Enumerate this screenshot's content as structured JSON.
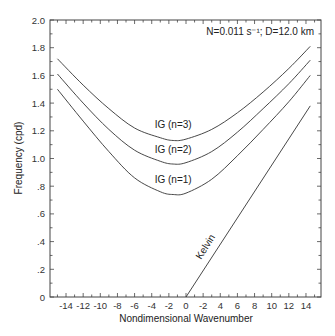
{
  "chart_data": {
    "type": "line",
    "title": "",
    "annotation": "N=0.011 s⁻¹; D=12.0 km",
    "xlabel": "Nondimensional Wavenumber",
    "ylabel": "Frequency (cpd)",
    "xlim": [
      -15.5,
      15.5
    ],
    "ylim": [
      0,
      2.0
    ],
    "grid": false,
    "legend": "none (inline curve labels)",
    "x_tick_values": [
      -14,
      -12,
      -10,
      -8,
      -6,
      -4,
      -2,
      0,
      2,
      4,
      6,
      8,
      10,
      12,
      14
    ],
    "x_tick_labels": [
      "-14",
      "-12",
      "-10",
      "-8",
      "-6",
      "-4",
      "-2",
      "0",
      "-2",
      "4",
      "6",
      "8",
      "10",
      "12",
      "14"
    ],
    "y_tick_values": [
      0,
      0.2,
      0.4,
      0.6,
      0.8,
      1.0,
      1.2,
      1.4,
      1.6,
      1.8,
      2.0
    ],
    "y_tick_labels": [
      "0",
      ".2",
      ".4",
      ".6",
      ".8",
      "1.0",
      "1.2",
      "1.4",
      "1.6",
      "1.8",
      "2.0"
    ],
    "series": [
      {
        "name": "IG (n=3)",
        "x": [
          -15,
          -12,
          -9,
          -6,
          -3,
          -1.5,
          0,
          3,
          6,
          9,
          12,
          14.5
        ],
        "values": [
          1.72,
          1.53,
          1.36,
          1.22,
          1.15,
          1.13,
          1.14,
          1.21,
          1.33,
          1.48,
          1.65,
          1.81
        ]
      },
      {
        "name": "IG (n=2)",
        "x": [
          -15,
          -12,
          -9,
          -6,
          -3,
          -1.5,
          0,
          3,
          6,
          9,
          12,
          14.5
        ],
        "values": [
          1.61,
          1.4,
          1.21,
          1.06,
          0.98,
          0.96,
          0.97,
          1.05,
          1.19,
          1.36,
          1.54,
          1.71
        ]
      },
      {
        "name": "IG (n=1)",
        "x": [
          -15,
          -12,
          -9,
          -6,
          -3,
          -1.5,
          0,
          3,
          6,
          9,
          12,
          14.5
        ],
        "values": [
          1.5,
          1.27,
          1.05,
          0.86,
          0.76,
          0.74,
          0.75,
          0.85,
          1.02,
          1.21,
          1.41,
          1.6
        ]
      },
      {
        "name": "Kelvin",
        "x": [
          0,
          14.5
        ],
        "values": [
          0,
          1.38
        ]
      }
    ],
    "curve_labels": [
      {
        "text": "IG (n=3)",
        "x": -1.5,
        "y": 1.22
      },
      {
        "text": "IG (n=2)",
        "x": -1.5,
        "y": 1.04
      },
      {
        "text": "IG (n=1)",
        "x": -1.5,
        "y": 0.82
      },
      {
        "text": "Kelvin",
        "x": 2.6,
        "y": 0.35,
        "rotation": -58
      }
    ]
  },
  "caption": {
    "text": ""
  },
  "colors": {
    "line": "#333333",
    "axis": "#444444",
    "background": "#ffffff"
  }
}
